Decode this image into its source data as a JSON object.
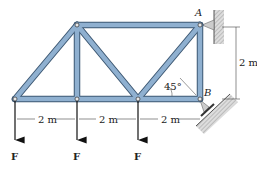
{
  "diagram": {
    "type": "truss",
    "supports": {
      "A": {
        "label": "A",
        "type": "pin-wall"
      },
      "B": {
        "label": "B",
        "type": "roller-inclined"
      }
    },
    "dimensions": {
      "height": "2 m",
      "spans": [
        "2 m",
        "2 m",
        "2 m"
      ]
    },
    "angle": "45°",
    "loads": [
      "F",
      "F",
      "F"
    ],
    "colors": {
      "member": "#8fb0d0",
      "member_edge": "#3d5873",
      "ground": "#c8c8c8"
    }
  }
}
